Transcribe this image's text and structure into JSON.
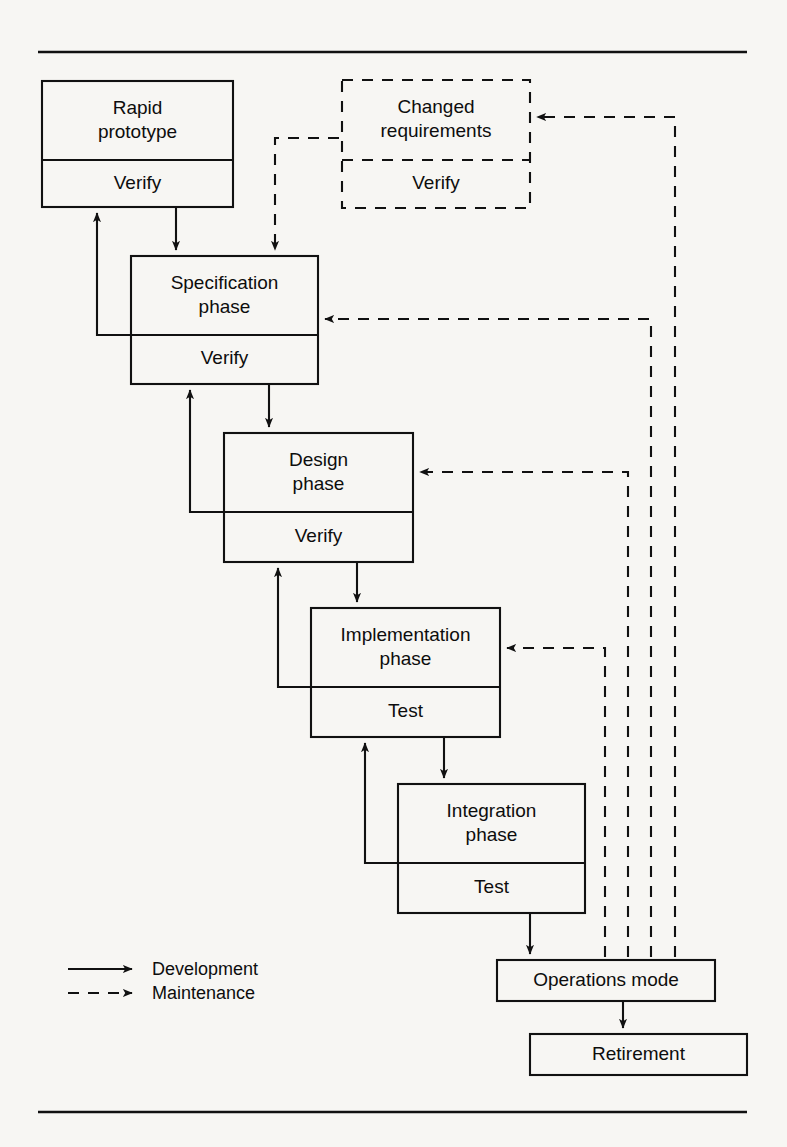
{
  "figure": {
    "kind": "software-lifecycle-flowchart"
  },
  "colors": {
    "ink": "#111111",
    "paper": "#f7f6f3"
  },
  "boxes": [
    {
      "id": "rapid-prototype",
      "title": "Rapid\nprototype",
      "title_line1": "Rapid",
      "title_line2": "prototype",
      "sub": "Verify",
      "style": "solid",
      "x": 42,
      "y": 81,
      "w": 191,
      "h": 126,
      "divider": 79
    },
    {
      "id": "changed-requirements",
      "title": "Changed\nrequirements",
      "title_line1": "Changed",
      "title_line2": "requirements",
      "sub": "Verify",
      "style": "dashed",
      "x": 342,
      "y": 80,
      "w": 188,
      "h": 128,
      "divider": 80
    },
    {
      "id": "specification-phase",
      "title": "Specification\nphase",
      "title_line1": "Specification",
      "title_line2": "phase",
      "sub": "Verify",
      "style": "solid",
      "x": 131,
      "y": 256,
      "w": 187,
      "h": 128,
      "divider": 79
    },
    {
      "id": "design-phase",
      "title": "Design\nphase",
      "title_line1": "Design",
      "title_line2": "phase",
      "sub": "Verify",
      "style": "solid",
      "x": 224,
      "y": 433,
      "w": 189,
      "h": 129,
      "divider": 79
    },
    {
      "id": "implementation-phase",
      "title": "Implementation\nphase",
      "title_line1": "Implementation",
      "title_line2": "phase",
      "sub": "Test",
      "style": "solid",
      "x": 311,
      "y": 608,
      "w": 189,
      "h": 129,
      "divider": 79
    },
    {
      "id": "integration-phase",
      "title": "Integration\nphase",
      "title_line1": "Integration",
      "title_line2": "phase",
      "sub": "Test",
      "style": "solid",
      "x": 398,
      "y": 784,
      "w": 187,
      "h": 129,
      "divider": 79
    },
    {
      "id": "operations-mode",
      "title": "Operations mode",
      "title_line1": "Operations mode",
      "title_line2": "",
      "sub": "",
      "style": "solid",
      "x": 497,
      "y": 960,
      "w": 218,
      "h": 41,
      "divider": 0
    },
    {
      "id": "retirement",
      "title": "Retirement",
      "title_line1": "Retirement",
      "title_line2": "",
      "sub": "",
      "style": "solid",
      "x": 530,
      "y": 1034,
      "w": 217,
      "h": 41,
      "divider": 0
    }
  ],
  "legend": {
    "items": [
      {
        "id": "development",
        "label": "Development",
        "style": "solid"
      },
      {
        "id": "maintenance",
        "label": "Maintenance",
        "style": "dashed"
      }
    ]
  },
  "flows": {
    "development": [
      {
        "from": "rapid-prototype",
        "to": "specification-phase"
      },
      {
        "from": "specification-phase",
        "to": "design-phase"
      },
      {
        "from": "design-phase",
        "to": "implementation-phase"
      },
      {
        "from": "implementation-phase",
        "to": "integration-phase"
      },
      {
        "from": "integration-phase",
        "to": "operations-mode"
      },
      {
        "from": "operations-mode",
        "to": "retirement"
      },
      {
        "from": "specification-phase",
        "to": "rapid-prototype",
        "kind": "verify-feedback"
      },
      {
        "from": "design-phase",
        "to": "specification-phase",
        "kind": "verify-feedback"
      },
      {
        "from": "implementation-phase",
        "to": "design-phase",
        "kind": "verify-feedback"
      },
      {
        "from": "integration-phase",
        "to": "implementation-phase",
        "kind": "test-feedback"
      }
    ],
    "maintenance": [
      {
        "from": "operations-mode",
        "to": "changed-requirements"
      },
      {
        "from": "changed-requirements",
        "to": "specification-phase"
      },
      {
        "from": "operations-mode",
        "to": "specification-phase"
      },
      {
        "from": "operations-mode",
        "to": "design-phase"
      },
      {
        "from": "operations-mode",
        "to": "implementation-phase"
      }
    ]
  },
  "rules": {
    "top_y": 52,
    "bottom_y": 1112
  }
}
